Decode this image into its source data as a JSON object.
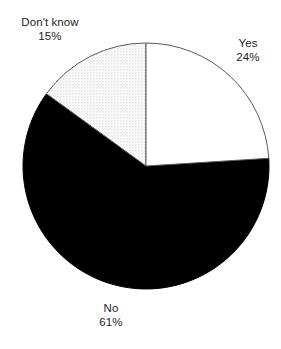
{
  "chart_data": {
    "type": "pie",
    "title": "",
    "subtitle": "",
    "xlabel": "",
    "ylabel": "",
    "grid": false,
    "legend_position": "none",
    "label_format": "name above percent",
    "start_angle_deg": 0,
    "direction": "clockwise",
    "categories": [
      "Yes",
      "No",
      "Don't know"
    ],
    "values": [
      24,
      61,
      15
    ],
    "unit": "%",
    "slices": [
      {
        "name": "Yes",
        "value": 24,
        "value_label": "24%",
        "fill": "#ffffff",
        "fill_style": "solid",
        "stroke": "#4a4a4a",
        "label_position": "outside-top-right",
        "start_angle_deg": 0,
        "sweep_deg": 86.4
      },
      {
        "name": "No",
        "value": 61,
        "value_label": "61%",
        "fill": "#000000",
        "fill_style": "solid",
        "stroke": "#000000",
        "label_position": "outside-bottom",
        "start_angle_deg": 86.4,
        "sweep_deg": 219.6
      },
      {
        "name": "Don't know",
        "value": 15,
        "value_label": "15%",
        "fill": "#ededed",
        "fill_style": "fine-dot-stipple",
        "stroke": "#4a4a4a",
        "label_position": "outside-top-left",
        "start_angle_deg": 306.0,
        "sweep_deg": 54.0
      }
    ],
    "geometry": {
      "center_x": 146,
      "center_y": 166,
      "radius": 123
    },
    "colors": {
      "background": "#ffffff",
      "text": "#1e1e1e",
      "outline": "#4a4a4a",
      "solid_slice": "#000000",
      "stipple_slice": "#ededed"
    }
  },
  "labels": {
    "yes": {
      "name": "Yes",
      "value": "24%"
    },
    "no": {
      "name": "No",
      "value": "61%"
    },
    "dontknow": {
      "name": "Don't know",
      "value": "15%"
    }
  }
}
